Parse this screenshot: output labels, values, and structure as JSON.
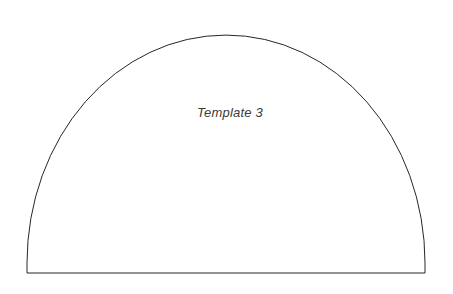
{
  "canvas": {
    "width": 453,
    "height": 294,
    "background_color": "#ffffff"
  },
  "shape": {
    "name": "semicircular-arch-template",
    "type": "semi-ellipse-on-baseline",
    "stroke_color": "#262626",
    "stroke_width": 1,
    "fill_color": "#ffffff",
    "geometry": {
      "left_x": 27,
      "right_x": 425,
      "baseline_y": 273,
      "apex_y": 35,
      "width": 398,
      "height": 238,
      "arch_rx": 199,
      "arch_ry": 228,
      "side_wall_height": 10
    },
    "path": "M 27 273 L 27 263 A 199 228 0 0 1 425 263 L 425 273 Z"
  },
  "label": {
    "text": "Template 3",
    "color": "#3a3a3a",
    "font_size": 13,
    "font_style": "italic",
    "center_x": 230,
    "baseline_y": 117
  }
}
